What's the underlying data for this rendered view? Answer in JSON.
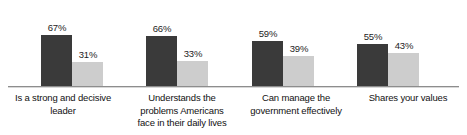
{
  "chart_data": {
    "type": "bar",
    "title": "",
    "subtitle": "",
    "xlabel": "",
    "ylabel": "",
    "ylim": [
      0,
      100
    ],
    "grid": false,
    "legend": "none",
    "orientation": "vertical",
    "grouping": "grouped",
    "value_suffix": "%",
    "categories": [
      "Is a strong and decisive leader",
      "Understands the problems Americans face in their daily lives",
      "Can manage the government effectively",
      "Shares your values"
    ],
    "category_lines": [
      [
        "Is a strong and decisive",
        "leader"
      ],
      [
        "Understands the",
        "problems Americans",
        "face in their daily lives"
      ],
      [
        "Can manage the",
        "government effectively"
      ],
      [
        "Shares your values"
      ]
    ],
    "series": [
      {
        "name": "series-dark",
        "color": "#3a3a3a",
        "values": [
          67,
          66,
          59,
          55
        ],
        "labels": [
          "67%",
          "66%",
          "59%",
          "55%"
        ]
      },
      {
        "name": "series-light",
        "color": "#cdcdcd",
        "values": [
          31,
          33,
          39,
          43
        ],
        "labels": [
          "31%",
          "33%",
          "39%",
          "43%"
        ]
      }
    ],
    "axis": {
      "baseline_color": "#8d8d8d"
    },
    "layout": {
      "groups": [
        {
          "left": 41,
          "label_left": 0,
          "label_width": 126
        },
        {
          "left": 146,
          "label_left": 122,
          "label_width": 120
        },
        {
          "left": 252,
          "label_left": 236,
          "label_width": 120
        },
        {
          "left": 357,
          "label_left": 352,
          "label_width": 112
        }
      ],
      "bar_width": 31,
      "baseline_y": 86,
      "px_per_percent": 0.762
    }
  }
}
